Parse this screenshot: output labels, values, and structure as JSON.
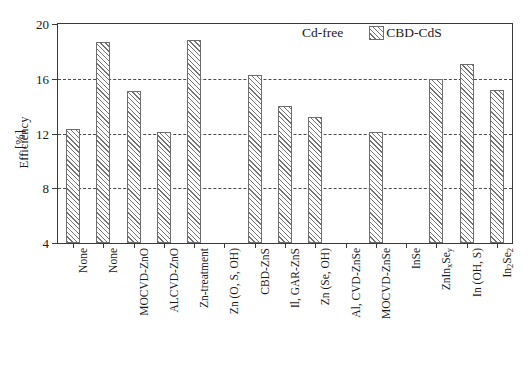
{
  "chart_data": {
    "type": "bar",
    "title": "",
    "xlabel": "",
    "ylabel": "Efficiency",
    "ylabel_unit": "[%]",
    "ylim": [
      4,
      20
    ],
    "yticks": [
      4,
      8,
      12,
      16,
      20
    ],
    "grid": "horizontal-dashed",
    "legend_position": "top-right",
    "legend": [
      {
        "name": "Cd-free",
        "style": "plain"
      },
      {
        "name": "CBD-CdS",
        "style": "hatched"
      }
    ],
    "categories": [
      "None",
      "None",
      "MOCVD-ZnO",
      "ALCVD-ZnO",
      "Zn-treatment",
      "Zn (O, S, OH)",
      "CBD-ZnS",
      "Il, GAR-ZnS",
      "Zn (Se, OH)",
      "Al, CVD-ZnSe",
      "MOCVD-ZnSe",
      "InSe",
      "ZnIn_xSe_y",
      "In (OH, S)",
      "In_2Se_2"
    ],
    "categories_html": [
      "None",
      "None",
      "MOCVD-ZnO",
      "ALCVD-ZnO",
      "Zn-treatment",
      "Zn (O, S, OH)",
      "CBD-ZnS",
      "Il, GAR-ZnS",
      "Zn (Se, OH)",
      "Al, CVD-ZnSe",
      "MOCVD-ZnSe",
      "InSe",
      "ZnIn<sub>x</sub>Se<sub>y</sub>",
      "In (OH, S)",
      "In<sub>2</sub>Se<sub>2</sub>"
    ],
    "series": [
      {
        "name": "CBD-CdS",
        "style": "hatched",
        "values": [
          12.3,
          18.7,
          15.1,
          12.1,
          18.8,
          null,
          16.3,
          14.0,
          13.2,
          null,
          12.1,
          null,
          16.0,
          17.1,
          15.2
        ]
      }
    ]
  }
}
